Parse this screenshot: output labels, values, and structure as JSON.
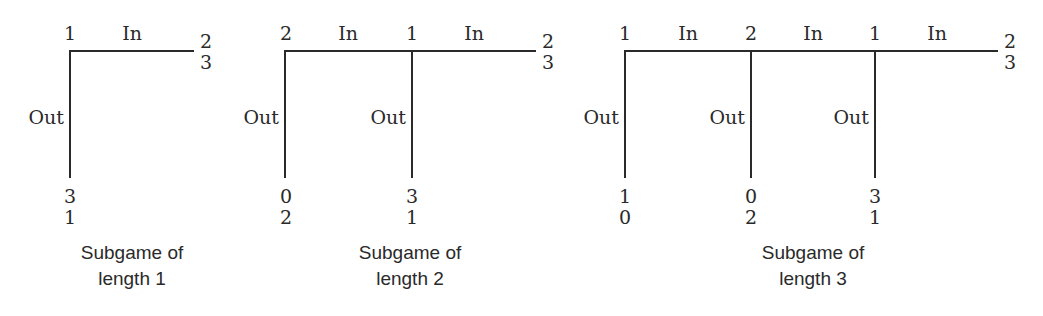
{
  "diagram": {
    "type": "game-tree-subgames",
    "subgames": [
      {
        "caption_line1": "Subgame of",
        "caption_line2": "length 1",
        "nodes": [
          {
            "player": "1",
            "out_label": "Out",
            "out_payoff": [
              "3",
              "1"
            ],
            "in_label": "In"
          }
        ],
        "terminal_in_payoff": [
          "2",
          "3"
        ]
      },
      {
        "caption_line1": "Subgame of",
        "caption_line2": "length 2",
        "nodes": [
          {
            "player": "2",
            "out_label": "Out",
            "out_payoff": [
              "0",
              "2"
            ],
            "in_label": "In"
          },
          {
            "player": "1",
            "out_label": "Out",
            "out_payoff": [
              "3",
              "1"
            ],
            "in_label": "In"
          }
        ],
        "terminal_in_payoff": [
          "2",
          "3"
        ]
      },
      {
        "caption_line1": "Subgame of",
        "caption_line2": "length 3",
        "nodes": [
          {
            "player": "1",
            "out_label": "Out",
            "out_payoff": [
              "1",
              "0"
            ],
            "in_label": "In"
          },
          {
            "player": "2",
            "out_label": "Out",
            "out_payoff": [
              "0",
              "2"
            ],
            "in_label": "In"
          },
          {
            "player": "1",
            "out_label": "Out",
            "out_payoff": [
              "3",
              "1"
            ],
            "in_label": "In"
          }
        ],
        "terminal_in_payoff": [
          "2",
          "3"
        ]
      }
    ]
  }
}
